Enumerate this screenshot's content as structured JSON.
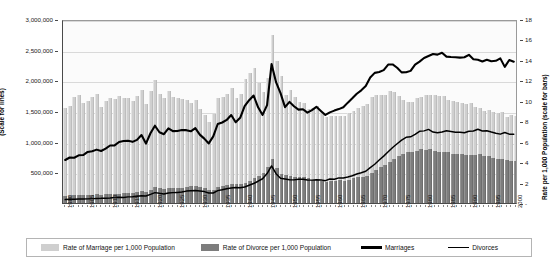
{
  "chart_data": {
    "type": "bar",
    "title": "",
    "subtitle": "",
    "xlabel": "",
    "ylabel": "(Scale for lines)",
    "y2label": "Rate per 1,000 Population (scale for bars)",
    "grid": true,
    "legend_position": "bottom",
    "ylim": [
      0,
      3000000
    ],
    "y2lim": [
      0,
      18
    ],
    "xlim": [
      1900,
      2000
    ],
    "y_ticks": [
      "500,000",
      "1,000,000",
      "1,500,000",
      "2,000,000",
      "2,500,000",
      "3,000,000"
    ],
    "y_tick_values": [
      500000,
      1000000,
      1500000,
      2000000,
      2500000,
      3000000
    ],
    "y2_ticks": [
      "-",
      "2",
      "4",
      "6",
      "8",
      "10",
      "12",
      "14",
      "16",
      "18"
    ],
    "y2_tick_values": [
      0,
      2,
      4,
      6,
      8,
      10,
      12,
      14,
      16,
      18
    ],
    "x_ticks": [
      "1900",
      "1905",
      "1910",
      "1915",
      "1920",
      "1925",
      "1930",
      "1935",
      "1940",
      "1945",
      "1950",
      "1955",
      "1960",
      "1965",
      "1970",
      "1975",
      "1980",
      "1985",
      "1990",
      "1995",
      "2000"
    ],
    "x_tick_values": [
      1900,
      1905,
      1910,
      1915,
      1920,
      1925,
      1930,
      1935,
      1940,
      1945,
      1950,
      1955,
      1960,
      1965,
      1970,
      1975,
      1980,
      1985,
      1990,
      1995,
      2000
    ],
    "colors": {
      "marriage_rate_bar": "#cfcfcf",
      "divorce_rate_bar": "#7d7d7d",
      "marriages_line": "#000000",
      "divorces_line": "#000000",
      "plot_background": "#fbfbfb",
      "gridline": "#d9d9d9",
      "axis": "#4a4a4a"
    },
    "legend": [
      {
        "label": "Rate of Marriage per 1,000 Population",
        "type": "bar",
        "color": "#cfcfcf"
      },
      {
        "label": "Rate of Divorce per 1,000 Population",
        "type": "bar",
        "color": "#7d7d7d"
      },
      {
        "label": "Marriages",
        "type": "line",
        "color": "#000000",
        "width": "thick"
      },
      {
        "label": "Divorces",
        "type": "line",
        "color": "#000000",
        "width": "thin"
      }
    ],
    "x": [
      1900,
      1901,
      1902,
      1903,
      1904,
      1905,
      1906,
      1907,
      1908,
      1909,
      1910,
      1911,
      1912,
      1913,
      1914,
      1915,
      1916,
      1917,
      1918,
      1919,
      1920,
      1921,
      1922,
      1923,
      1924,
      1925,
      1926,
      1927,
      1928,
      1929,
      1930,
      1931,
      1932,
      1933,
      1934,
      1935,
      1936,
      1937,
      1938,
      1939,
      1940,
      1941,
      1942,
      1943,
      1944,
      1945,
      1946,
      1947,
      1948,
      1949,
      1950,
      1951,
      1952,
      1953,
      1954,
      1955,
      1956,
      1957,
      1958,
      1959,
      1960,
      1961,
      1962,
      1963,
      1964,
      1965,
      1966,
      1967,
      1968,
      1969,
      1970,
      1971,
      1972,
      1973,
      1974,
      1975,
      1976,
      1977,
      1978,
      1979,
      1980,
      1981,
      1982,
      1983,
      1984,
      1985,
      1986,
      1987,
      1988,
      1989,
      1990,
      1991,
      1992,
      1993,
      1994,
      1995,
      1996,
      1997,
      1998,
      1999,
      2000
    ],
    "series": [
      {
        "name": "Rate of Marriage per 1,000 Population",
        "axis": "right",
        "type": "bar",
        "values": [
          9.3,
          9.5,
          10.4,
          10.6,
          9.8,
          10.0,
          10.4,
          10.7,
          9.4,
          10.0,
          10.3,
          10.2,
          10.5,
          10.3,
          10.3,
          10.0,
          10.5,
          11.1,
          9.7,
          11.0,
          12.0,
          10.7,
          10.3,
          11.0,
          10.4,
          10.3,
          10.2,
          10.1,
          9.8,
          10.1,
          9.2,
          8.6,
          7.9,
          8.7,
          10.3,
          10.4,
          10.7,
          11.3,
          10.3,
          10.7,
          12.1,
          12.7,
          13.2,
          11.7,
          10.9,
          12.2,
          16.4,
          13.9,
          12.4,
          10.6,
          11.1,
          10.4,
          9.9,
          9.8,
          9.2,
          9.3,
          9.5,
          8.9,
          8.4,
          8.5,
          8.5,
          8.5,
          8.5,
          8.8,
          9.0,
          9.3,
          9.5,
          9.7,
          10.4,
          10.6,
          10.6,
          10.6,
          11.0,
          10.9,
          10.5,
          10.1,
          9.9,
          9.9,
          10.3,
          10.4,
          10.6,
          10.6,
          10.6,
          10.5,
          10.5,
          10.1,
          10.0,
          9.9,
          9.8,
          9.7,
          9.8,
          9.4,
          9.3,
          9.0,
          9.1,
          8.9,
          8.8,
          8.9,
          8.4,
          8.6,
          8.5
        ]
      },
      {
        "name": "Rate of Divorce per 1,000 Population",
        "axis": "right",
        "type": "bar",
        "values": [
          0.7,
          0.7,
          0.8,
          0.8,
          0.8,
          0.8,
          0.8,
          0.9,
          0.8,
          0.9,
          0.9,
          0.9,
          0.9,
          1.0,
          1.0,
          1.0,
          1.1,
          1.2,
          1.1,
          1.3,
          1.6,
          1.5,
          1.4,
          1.5,
          1.5,
          1.5,
          1.5,
          1.6,
          1.7,
          1.7,
          1.6,
          1.5,
          1.3,
          1.3,
          1.6,
          1.7,
          1.8,
          1.9,
          1.9,
          1.9,
          2.0,
          2.2,
          2.4,
          2.6,
          2.9,
          3.5,
          4.3,
          3.4,
          2.8,
          2.7,
          2.6,
          2.5,
          2.5,
          2.5,
          2.4,
          2.3,
          2.3,
          2.2,
          2.1,
          2.2,
          2.2,
          2.3,
          2.2,
          2.3,
          2.4,
          2.5,
          2.5,
          2.6,
          2.9,
          3.2,
          3.5,
          3.7,
          4.0,
          4.3,
          4.6,
          4.8,
          5.0,
          5.0,
          5.1,
          5.3,
          5.2,
          5.3,
          5.1,
          5.0,
          5.0,
          5.0,
          4.8,
          4.8,
          4.8,
          4.7,
          4.7,
          4.7,
          4.8,
          4.6,
          4.6,
          4.4,
          4.3,
          4.3,
          4.2,
          4.1,
          4.1
        ]
      },
      {
        "name": "Marriages",
        "axis": "left",
        "type": "line",
        "values": [
          709000,
          750000,
          746000,
          786000,
          790000,
          842000,
          853000,
          880000,
          857000,
          897000,
          948000,
          949000,
          1005000,
          1021000,
          1025000,
          1008000,
          1040000,
          1120000,
          980000,
          1150000,
          1274000,
          1166000,
          1134000,
          1230000,
          1185000,
          1188000,
          1203000,
          1201000,
          1182000,
          1233000,
          1127000,
          1061000,
          982000,
          1098000,
          1302000,
          1327000,
          1369000,
          1451000,
          1331000,
          1404000,
          1596000,
          1695000,
          1772000,
          1577000,
          1452000,
          1613000,
          2291000,
          1992000,
          1811000,
          1580000,
          1667000,
          1595000,
          1539000,
          1546000,
          1490000,
          1531000,
          1585000,
          1518000,
          1451000,
          1494000,
          1523000,
          1548000,
          1577000,
          1654000,
          1725000,
          1800000,
          1857000,
          1927000,
          2069000,
          2145000,
          2159000,
          2190000,
          2282000,
          2284000,
          2230000,
          2153000,
          2155000,
          2178000,
          2282000,
          2331000,
          2390000,
          2422000,
          2456000,
          2446000,
          2477000,
          2413000,
          2407000,
          2403000,
          2396000,
          2403000,
          2443000,
          2371000,
          2362000,
          2334000,
          2362000,
          2336000,
          2344000,
          2384000,
          2244000,
          2358000,
          2329000
        ]
      },
      {
        "name": "Divorces",
        "axis": "left",
        "type": "line",
        "values": [
          56000,
          61000,
          61000,
          64000,
          66000,
          68000,
          72000,
          76000,
          77000,
          80000,
          83000,
          89000,
          94000,
          92000,
          101000,
          104000,
          112000,
          121000,
          116000,
          142000,
          171000,
          159000,
          149000,
          165000,
          171000,
          175000,
          180000,
          196000,
          200000,
          205000,
          196000,
          188000,
          164000,
          165000,
          204000,
          218000,
          236000,
          249000,
          256000,
          251000,
          264000,
          293000,
          321000,
          359000,
          400000,
          485000,
          610000,
          483000,
          408000,
          397000,
          385000,
          381000,
          392000,
          390000,
          379000,
          377000,
          382000,
          381000,
          368000,
          395000,
          393000,
          414000,
          413000,
          428000,
          450000,
          479000,
          499000,
          523000,
          584000,
          639000,
          708000,
          773000,
          845000,
          915000,
          977000,
          1036000,
          1083000,
          1091000,
          1130000,
          1181000,
          1189000,
          1213000,
          1170000,
          1158000,
          1169000,
          1190000,
          1178000,
          1166000,
          1167000,
          1157000,
          1182000,
          1187000,
          1215000,
          1187000,
          1191000,
          1169000,
          1150000,
          1135000,
          1163000,
          1135000,
          1135000
        ]
      }
    ]
  }
}
